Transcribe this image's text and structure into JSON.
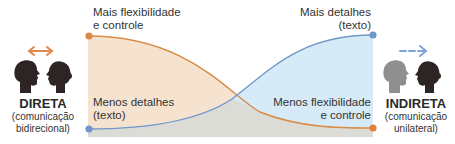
{
  "left_mode": {
    "title": "DIRETA",
    "subtitle_line1": "(comunicação",
    "subtitle_line2": "bidirecional)",
    "arrow": "double-headed-arrow",
    "arrow_color": "#e0894a"
  },
  "right_mode": {
    "title": "INDIRETA",
    "subtitle_line1": "(comunicação",
    "subtitle_line2": "unilateral)",
    "arrow": "dashed-right-arrow",
    "arrow_color": "#7ea3d6"
  },
  "labels": {
    "top_left_line1": "Mais flexibilidade",
    "top_left_line2": "e controle",
    "bottom_left_line1": "Menos detalhes",
    "bottom_left_line2": "(texto)",
    "top_right_line1": "Mais detalhes",
    "top_right_line2": "(texto)",
    "bottom_right_line1": "Menos flexibilidade",
    "bottom_right_line2": "e controle"
  },
  "colors": {
    "flexibility_curve": "#d98a45",
    "flexibility_fill": "#f6e3cf",
    "detail_curve": "#7196cc",
    "detail_fill": "#d4e9f7",
    "overlap_fill": "#dcdcd6"
  },
  "curves": [
    {
      "name": "Flexibilidade e controle",
      "start": "Mais",
      "end": "Menos",
      "trend": "decreasing"
    },
    {
      "name": "Detalhes (texto)",
      "start": "Menos",
      "end": "Mais",
      "trend": "increasing"
    }
  ]
}
